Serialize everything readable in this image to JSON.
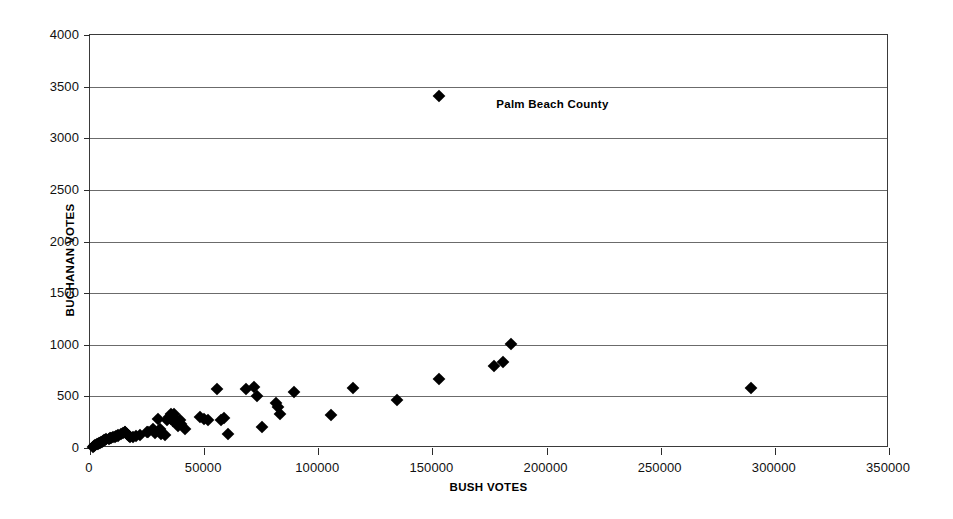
{
  "chart_data": {
    "type": "scatter",
    "title": "",
    "xlabel": "BUSH VOTES",
    "ylabel": "BUCHANAN VOTES",
    "xlim": [
      0,
      350000
    ],
    "ylim": [
      0,
      4000
    ],
    "xticks": [
      0,
      50000,
      100000,
      150000,
      200000,
      250000,
      300000,
      350000
    ],
    "yticks": [
      0,
      500,
      1000,
      1500,
      2000,
      2500,
      3000,
      3500,
      4000
    ],
    "xtick_labels": [
      "0",
      "50000",
      "100000",
      "150000",
      "200000",
      "250000",
      "300000",
      "350000"
    ],
    "ytick_labels": [
      "0",
      "500",
      "1000",
      "1500",
      "2000",
      "2500",
      "3000",
      "3500",
      "4000"
    ],
    "grid": "horizontal",
    "legend": "none",
    "marker": "filled-diamond",
    "marker_color": "#000000",
    "series": [
      {
        "name": "Florida counties",
        "points": [
          [
            1316,
            9
          ],
          [
            1769,
            22
          ],
          [
            2146,
            29
          ],
          [
            2873,
            35
          ],
          [
            3300,
            38
          ],
          [
            4256,
            45
          ],
          [
            4051,
            52
          ],
          [
            4985,
            57
          ],
          [
            5413,
            62
          ],
          [
            5610,
            68
          ],
          [
            6237,
            75
          ],
          [
            6541,
            78
          ],
          [
            7101,
            84
          ],
          [
            8136,
            90
          ],
          [
            8587,
            95
          ],
          [
            9138,
            98
          ],
          [
            9893,
            105
          ],
          [
            10964,
            108
          ],
          [
            11242,
            112
          ],
          [
            12173,
            120
          ],
          [
            12176,
            125
          ],
          [
            13439,
            133
          ],
          [
            14630,
            145
          ],
          [
            15196,
            152
          ],
          [
            15446,
            158
          ],
          [
            16010,
            140
          ],
          [
            17207,
            120
          ],
          [
            17379,
            108
          ],
          [
            18683,
            110
          ],
          [
            20196,
            118
          ],
          [
            22070,
            122
          ],
          [
            24832,
            155
          ],
          [
            25309,
            152
          ],
          [
            27647,
            182
          ],
          [
            28635,
            147
          ],
          [
            29645,
            277
          ],
          [
            30646,
            188
          ],
          [
            31045,
            140
          ],
          [
            32647,
            122
          ],
          [
            33864,
            270
          ],
          [
            34705,
            305
          ],
          [
            35419,
            283
          ],
          [
            35426,
            332
          ],
          [
            36287,
            257
          ],
          [
            36806,
            325
          ],
          [
            37628,
            270
          ],
          [
            38637,
            212
          ],
          [
            39497,
            267
          ],
          [
            40070,
            228
          ],
          [
            41736,
            182
          ],
          [
            48118,
            296
          ],
          [
            50010,
            282
          ],
          [
            51746,
            270
          ],
          [
            55816,
            570
          ],
          [
            57435,
            274
          ],
          [
            58607,
            286
          ],
          [
            60426,
            133
          ],
          [
            68440,
            575
          ],
          [
            71854,
            588
          ],
          [
            73029,
            503
          ],
          [
            75293,
            206
          ],
          [
            81448,
            434
          ],
          [
            82546,
            396
          ],
          [
            83054,
            333
          ],
          [
            89338,
            540
          ],
          [
            105405,
            321
          ],
          [
            115155,
            581
          ],
          [
            134530,
            465
          ],
          [
            152846,
            667
          ],
          [
            176967,
            798
          ],
          [
            180760,
            836
          ],
          [
            184312,
            1010
          ],
          [
            289456,
            580
          ]
        ]
      },
      {
        "name": "Palm Beach County",
        "points": [
          [
            152951,
            3407
          ]
        ]
      }
    ],
    "annotations": [
      {
        "text": "Palm Beach County",
        "x": 178000,
        "y": 3330,
        "refers_to_point": [
          152951,
          3407
        ]
      }
    ]
  }
}
